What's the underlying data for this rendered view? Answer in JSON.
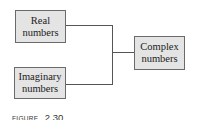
{
  "diagram": {
    "type": "tree-merge",
    "nodes": [
      {
        "id": "real",
        "lines": [
          "Real",
          "numbers"
        ]
      },
      {
        "id": "imaginary",
        "lines": [
          "Imaginary",
          "numbers"
        ]
      },
      {
        "id": "complex",
        "lines": [
          "Complex",
          "numbers"
        ]
      }
    ],
    "edges": [
      {
        "from": "real",
        "to": "complex"
      },
      {
        "from": "imaginary",
        "to": "complex"
      }
    ],
    "colors": {
      "box_fill": "#e4e4e4",
      "box_border": "#6a6a6a",
      "line": "#555555",
      "text": "#222222"
    }
  },
  "caption": {
    "word": "FIGURE",
    "number": "2.30"
  }
}
